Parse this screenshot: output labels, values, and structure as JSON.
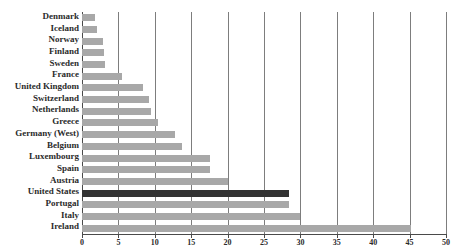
{
  "chart_data": {
    "type": "bar",
    "orientation": "horizontal",
    "title": "",
    "xlabel": "",
    "ylabel": "",
    "xlim": [
      0,
      50
    ],
    "xticks": [
      0,
      5,
      10,
      15,
      20,
      25,
      30,
      35,
      40,
      45,
      50
    ],
    "xtick_labels": [
      "0",
      "5",
      "10",
      "15",
      "20",
      "25",
      "30",
      "35",
      "40",
      "45",
      "50"
    ],
    "grid": "vertical",
    "legend": "none",
    "categories": [
      "Denmark",
      "Iceland",
      "Norway",
      "Finland",
      "Sweden",
      "France",
      "United Kingdom",
      "Switzerland",
      "Netherlands",
      "Greece",
      "Germany (West)",
      "Belgium",
      "Luxembourg",
      "Spain",
      "Austria",
      "United States",
      "Portugal",
      "Italy",
      "Ireland"
    ],
    "values": [
      1.8,
      2.0,
      2.9,
      3.0,
      3.1,
      5.5,
      8.4,
      9.2,
      9.5,
      10.4,
      12.8,
      13.7,
      17.6,
      17.6,
      20.0,
      28.4,
      28.4,
      30.0,
      45.2
    ],
    "highlight_category": "United States",
    "colors": {
      "bar": "#a8a8a8",
      "bar_highlight": "#333333",
      "gridline": "#7d7d7d",
      "axis": "#4a4a4a",
      "text": "#2b2b2b",
      "background": "#ffffff"
    }
  }
}
